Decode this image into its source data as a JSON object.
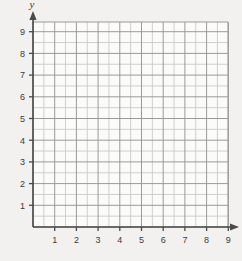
{
  "figure": {
    "name": "blank-coordinate-grid",
    "background_color": "#f2f1ef"
  },
  "chart_data": {
    "type": "scatter",
    "title": "",
    "subtitle": "",
    "xlabel": "x",
    "ylabel": "y",
    "x": [],
    "y": [],
    "series": [],
    "annotations": [],
    "legend": null,
    "legend_position": "none",
    "grid": true,
    "grid_major_step": 1,
    "grid_minor_step": 0.5,
    "xlim": [
      0,
      9.75
    ],
    "ylim": [
      0,
      10.25
    ],
    "xticks": [
      1,
      2,
      3,
      4,
      5,
      6,
      7,
      8,
      9
    ],
    "yticks": [
      1,
      2,
      3,
      4,
      5,
      6,
      7,
      8,
      9
    ],
    "xtick_labels": [
      "1",
      "2",
      "3",
      "4",
      "5",
      "6",
      "7",
      "8",
      "9"
    ],
    "ytick_labels": [
      "1",
      "2",
      "3",
      "4",
      "5",
      "6",
      "7",
      "8",
      "9"
    ],
    "origin_label": "",
    "x_axis_arrow": true,
    "y_axis_arrow": true
  },
  "colors": {
    "axis": "#4a4a4a",
    "grid_major": "#9a9a9a",
    "grid_minor": "#cfcfcf",
    "grid_fill": "#fbfbfa",
    "text": "#3b3b3b",
    "background": "#f2f1ef"
  },
  "geometry": {
    "origin_x": 33,
    "origin_y": 227,
    "unit_px": 21.7,
    "grid_right": 228,
    "grid_top": 22
  },
  "labels": {
    "x_axis_name": "x",
    "y_axis_name": "y"
  }
}
